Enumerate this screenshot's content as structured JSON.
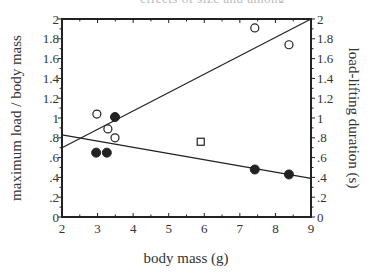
{
  "chart_data": {
    "type": "scatter",
    "title": "",
    "xlabel": "body mass (g)",
    "ylabel": "maximum load / body mass",
    "y2label": "load-lifting duration (s)",
    "xlim": [
      2,
      9
    ],
    "ylim": [
      0,
      2
    ],
    "y2lim": [
      0,
      2
    ],
    "grid": false,
    "legend": null,
    "x_ticks": [
      "2",
      "3",
      "4",
      "5",
      "6",
      "7",
      "8",
      "9"
    ],
    "y_ticks": [
      "0",
      ".2",
      ".4",
      ".6",
      ".8",
      "1",
      "1.2",
      "1.4",
      "1.6",
      "1.8",
      "2"
    ],
    "y2_ticks": [
      "0",
      ".2",
      ".4",
      ".6",
      ".8",
      "1",
      "1.2",
      "1.4",
      "1.6",
      "1.8",
      "2"
    ],
    "series": [
      {
        "name": "maximum load / body mass",
        "marker": "open-circle",
        "axis": "left",
        "points": [
          [
            2.98,
            1.04
          ],
          [
            3.29,
            0.89
          ],
          [
            3.49,
            0.8
          ],
          [
            7.42,
            1.91
          ],
          [
            8.38,
            1.74
          ]
        ]
      },
      {
        "name": "load-lifting duration",
        "marker": "filled-circle",
        "axis": "right",
        "points": [
          [
            2.96,
            0.65
          ],
          [
            3.26,
            0.65
          ],
          [
            3.49,
            1.01
          ],
          [
            7.42,
            0.48
          ],
          [
            8.38,
            0.43
          ]
        ]
      },
      {
        "name": "outlier",
        "marker": "open-square",
        "axis": "left",
        "points": [
          [
            5.9,
            0.76
          ]
        ]
      }
    ],
    "fit_lines": [
      {
        "name": "rising fit (max load / body mass)",
        "from": [
          2,
          0.7
        ],
        "to": [
          9,
          2.0
        ]
      },
      {
        "name": "declining fit (load-lifting duration)",
        "from": [
          2,
          0.83
        ],
        "to": [
          9,
          0.39
        ]
      }
    ]
  },
  "header_fragment": "effects of size and among"
}
